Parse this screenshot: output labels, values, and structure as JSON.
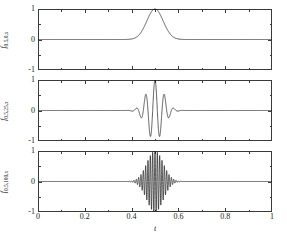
{
  "figure": {
    "background": "#ffffff",
    "axis_color": "#3a3a3a",
    "curve_color": "#1a1a1a",
    "xlabel": "t"
  },
  "chart_data": {
    "type": "line",
    "title": "",
    "xlabel": "t",
    "ylabel": "",
    "xlim": [
      0,
      1
    ],
    "ylim": [
      -1,
      1
    ],
    "grid": false,
    "legend": "none",
    "xticks": [
      0,
      0.2,
      0.4,
      0.6,
      0.8,
      1
    ],
    "xtick_labels": [
      "0",
      "0.2",
      "0.4",
      "0.6",
      "0.8",
      "1"
    ],
    "xminor_step": 0.1,
    "yticks": [
      -1,
      0,
      1
    ],
    "ytick_labels": [
      "-1",
      "0",
      "1"
    ],
    "panels": [
      {
        "ylabel": "f",
        "ylabel_sub": "0.5,0,x",
        "center": 0.5,
        "frequency": 0,
        "sigma": 0.035,
        "description": "Gaussian envelope, no oscillation; single positive peak of amplitude 1 at t = 0.5",
        "peak_value": 1.0,
        "min_value": 0.0,
        "support": [
          0.36,
          0.64
        ]
      },
      {
        "ylabel": "f",
        "ylabel_sub": "0.5,25,x",
        "center": 0.5,
        "frequency": 25,
        "sigma": 0.035,
        "description": "Gabor wavelet; central peak 1 at t = 0.5 with negative side lobes near -0.55 and small outer positive lobes",
        "peak_value": 1.0,
        "min_value": -0.56,
        "support": [
          0.39,
          0.61
        ]
      },
      {
        "ylabel": "f",
        "ylabel_sub": "0.5,100,x",
        "center": 0.5,
        "frequency": 100,
        "sigma": 0.035,
        "description": "Gabor wavelet with higher oscillation rate; several lobes within the same Gaussian envelope",
        "peak_value": 1.0,
        "min_value": -0.82,
        "support": [
          0.4,
          0.6
        ]
      }
    ]
  }
}
